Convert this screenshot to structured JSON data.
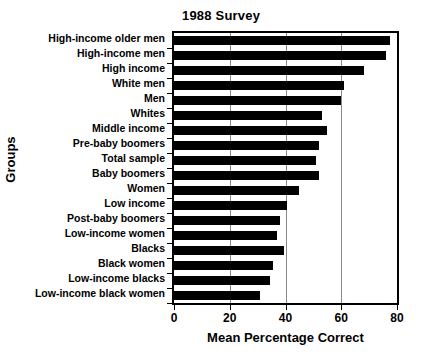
{
  "chart_data": {
    "type": "bar",
    "orientation": "horizontal",
    "title": "1988 Survey",
    "xlabel": "Mean Percentage Correct",
    "ylabel": "Groups",
    "xlim": [
      0,
      80
    ],
    "xticks": [
      0,
      20,
      40,
      60,
      80
    ],
    "xtick_labels": [
      "0",
      "20",
      "40",
      "60",
      "80"
    ],
    "grid": "vertical",
    "legend": "none",
    "bar_color": "#000000",
    "background_color": "#ffffff",
    "categories": [
      "High-income older men",
      "High-income men",
      "High income",
      "White men",
      "Men",
      "Whites",
      "Middle income",
      "Pre-baby boomers",
      "Total sample",
      "Baby boomers",
      "Women",
      "Low income",
      "Post-baby boomers",
      "Low-income women",
      "Blacks",
      "Black women",
      "Low-income blacks",
      "Low-income black women"
    ],
    "values": [
      77.5,
      76.0,
      68.0,
      61.0,
      60.0,
      53.0,
      55.0,
      52.0,
      51.0,
      52.0,
      45.0,
      40.5,
      38.0,
      37.0,
      39.5,
      35.5,
      34.5,
      31.0
    ]
  }
}
